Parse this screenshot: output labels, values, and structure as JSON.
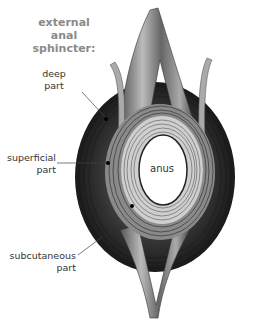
{
  "title": {
    "line1": "external anal",
    "line2": "sphincter:"
  },
  "labels": {
    "deep": {
      "line1": "deep",
      "line2": "part"
    },
    "superficial": {
      "line1": "superficial",
      "line2": "part"
    },
    "subcutaneous": {
      "line1": "subcutaneous",
      "line2": "part"
    },
    "anus": "anus"
  },
  "colors": {
    "title": "#8a8a8a",
    "label": "#333333",
    "muscle_dark": "#2a2a2a",
    "muscle_mid": "#6e6e6e",
    "muscle_light": "#bdbdbd"
  }
}
